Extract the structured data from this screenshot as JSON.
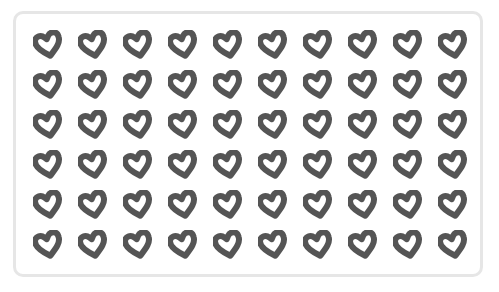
{
  "scene": {
    "description": "Grid of donut-shaped heart icons inside a rounded frame",
    "rows": 6,
    "columns": 10,
    "total_items": 60,
    "item_icon": "heart-outline-icon",
    "colors": {
      "heart": "#555555",
      "frame_border": "#e6e6e6",
      "background": "#ffffff"
    }
  }
}
